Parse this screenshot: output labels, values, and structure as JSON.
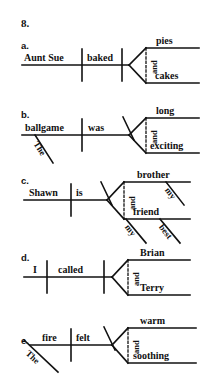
{
  "worksheet": {
    "number": "8.",
    "type": "sentence-diagram-exercise"
  },
  "items": [
    {
      "letter": "a.",
      "subject": "Aunt Sue",
      "verb": "baked",
      "conjunction": "and",
      "compound": [
        "pies",
        "cakes"
      ],
      "modifiers": []
    },
    {
      "letter": "b.",
      "subject": "ballgame",
      "verb": "was",
      "conjunction": "and",
      "compound": [
        "long",
        "exciting"
      ],
      "modifiers": [
        "The"
      ]
    },
    {
      "letter": "c.",
      "subject": "Shawn",
      "verb": "is",
      "conjunction": "and",
      "compound": [
        "brother",
        "friend"
      ],
      "modifiers": [
        "my",
        "my",
        "best"
      ]
    },
    {
      "letter": "d.",
      "subject": "I",
      "verb": "called",
      "conjunction": "and",
      "compound": [
        "Brian",
        "Terry"
      ],
      "modifiers": []
    },
    {
      "letter": "e.",
      "subject": "fire",
      "verb": "felt",
      "conjunction": "and",
      "compound": [
        "warm",
        "soothing"
      ],
      "modifiers": [
        "The"
      ]
    }
  ],
  "colors": {
    "ink": "#111111",
    "paper": "#ffffff"
  }
}
